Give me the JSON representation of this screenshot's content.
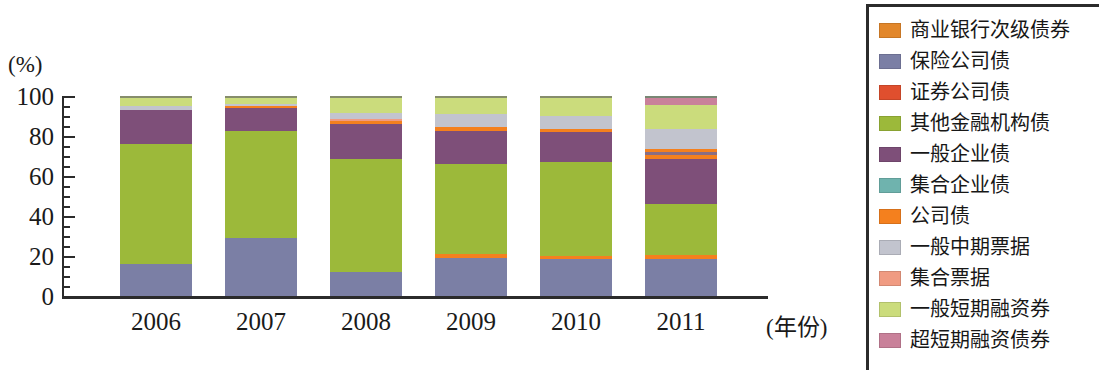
{
  "chart_data": {
    "type": "bar",
    "subtype": "stacked-100-percent",
    "title": "",
    "xlabel": "(年份)",
    "ylabel": "(%)",
    "ylim": [
      0,
      100
    ],
    "yticks": [
      0,
      20,
      40,
      60,
      80,
      100
    ],
    "ytick_labels": [
      "0",
      "20",
      "40",
      "60",
      "80",
      "100"
    ],
    "grid": false,
    "legend_position": "right",
    "categories": [
      "2006",
      "2007",
      "2008",
      "2009",
      "2010",
      "2011"
    ],
    "series": [
      {
        "name": "商业银行次级债券",
        "color": "#E2872B",
        "values": [
          0,
          0,
          0,
          0,
          0,
          0
        ]
      },
      {
        "name": "保险公司债",
        "color": "#7B7FA5",
        "values": [
          16.0,
          29.0,
          12.0,
          19.0,
          18.5,
          19.0
        ]
      },
      {
        "name": "证券公司债",
        "color": "#E04F2E",
        "values": [
          0,
          0,
          0,
          0,
          0,
          0
        ]
      },
      {
        "name": "其他金融机构债",
        "color": "#9CB93A",
        "values": [
          60.0,
          53.5,
          56.5,
          45.0,
          47.0,
          26.0
        ]
      },
      {
        "name": "一般企业债",
        "color": "#7E4F79",
        "values": [
          17.0,
          11.5,
          17.5,
          16.5,
          15.0,
          23.0
        ]
      },
      {
        "name": "集合企业债",
        "color": "#6FB3AE",
        "values": [
          0,
          0,
          0,
          0,
          0,
          0.8
        ]
      },
      {
        "name": "公司债",
        "color": "#F4801E",
        "values": [
          0,
          0.8,
          1.5,
          4.0,
          3.0,
          5.0
        ]
      },
      {
        "name": "一般中期票据",
        "color": "#C2C4CE",
        "values": [
          2.0,
          1.0,
          3.0,
          6.5,
          6.5,
          10.0
        ]
      },
      {
        "name": "集合票据",
        "color": "#F09B82",
        "values": [
          0,
          0,
          1.0,
          0,
          0,
          0
        ]
      },
      {
        "name": "一般短期融资券",
        "color": "#CBDC7C",
        "values": [
          5.0,
          4.2,
          8.5,
          9.0,
          10.0,
          12.5
        ]
      },
      {
        "name": "超短期融资债券",
        "color": "#C9819A",
        "values": [
          0,
          0,
          0,
          0,
          0,
          3.7
        ]
      }
    ],
    "stack_order_by_category": {
      "2006": [
        {
          "name": "保险公司债",
          "color": "#7B7FA5",
          "value": 16.0
        },
        {
          "name": "其他金融机构债",
          "color": "#9CB93A",
          "value": 60.0
        },
        {
          "name": "一般企业债",
          "color": "#7E4F79",
          "value": 17.0
        },
        {
          "name": "一般中期票据",
          "color": "#C2C4CE",
          "value": 2.0
        },
        {
          "name": "一般短期融资券",
          "color": "#CBDC7C",
          "value": 5.0
        }
      ],
      "2007": [
        {
          "name": "保险公司债",
          "color": "#7B7FA5",
          "value": 29.0
        },
        {
          "name": "其他金融机构债",
          "color": "#9CB93A",
          "value": 53.5
        },
        {
          "name": "一般企业债",
          "color": "#7E4F79",
          "value": 11.5
        },
        {
          "name": "公司债",
          "color": "#F4801E",
          "value": 0.8
        },
        {
          "name": "一般中期票据",
          "color": "#C2C4CE",
          "value": 1.0
        },
        {
          "name": "一般短期融资券",
          "color": "#CBDC7C",
          "value": 4.2
        }
      ],
      "2008": [
        {
          "name": "保险公司债",
          "color": "#7B7FA5",
          "value": 12.0
        },
        {
          "name": "其他金融机构债",
          "color": "#9CB93A",
          "value": 56.5
        },
        {
          "name": "一般企业债",
          "color": "#7E4F79",
          "value": 17.5
        },
        {
          "name": "公司债",
          "color": "#F4801E",
          "value": 1.5
        },
        {
          "name": "集合票据",
          "color": "#F09B82",
          "value": 1.0
        },
        {
          "name": "一般中期票据",
          "color": "#C2C4CE",
          "value": 3.0
        },
        {
          "name": "一般短期融资券",
          "color": "#CBDC7C",
          "value": 8.5
        }
      ],
      "2009": [
        {
          "name": "保险公司债",
          "color": "#7B7FA5",
          "value": 19.0
        },
        {
          "name": "公司债",
          "color": "#F4801E",
          "value": 2.0
        },
        {
          "name": "其他金融机构债",
          "color": "#9CB93A",
          "value": 45.0
        },
        {
          "name": "一般企业债",
          "color": "#7E4F79",
          "value": 16.5
        },
        {
          "name": "公司债",
          "color": "#F4801E",
          "value": 2.0
        },
        {
          "name": "一般中期票据",
          "color": "#C2C4CE",
          "value": 6.5
        },
        {
          "name": "一般短期融资券",
          "color": "#CBDC7C",
          "value": 9.0
        }
      ],
      "2010": [
        {
          "name": "保险公司债",
          "color": "#7B7FA5",
          "value": 18.5
        },
        {
          "name": "公司债",
          "color": "#F4801E",
          "value": 1.5
        },
        {
          "name": "其他金融机构债",
          "color": "#9CB93A",
          "value": 47.0
        },
        {
          "name": "一般企业债",
          "color": "#7E4F79",
          "value": 15.0
        },
        {
          "name": "公司债",
          "color": "#F4801E",
          "value": 1.5
        },
        {
          "name": "一般中期票据",
          "color": "#C2C4CE",
          "value": 6.5
        },
        {
          "name": "一般短期融资券",
          "color": "#CBDC7C",
          "value": 10.0
        }
      ],
      "2011": [
        {
          "name": "保险公司债",
          "color": "#7B7FA5",
          "value": 19.0
        },
        {
          "name": "公司债",
          "color": "#F4801E",
          "value": 2.0
        },
        {
          "name": "其他金融机构债",
          "color": "#9CB93A",
          "value": 26.0
        },
        {
          "name": "一般企业债",
          "color": "#7E4F79",
          "value": 23.0
        },
        {
          "name": "公司债",
          "color": "#F4801E",
          "value": 2.5
        },
        {
          "name": "一般企业债",
          "color": "#8A6E84",
          "value": 1.5
        },
        {
          "name": "公司债",
          "color": "#F4801E",
          "value": 1.5
        },
        {
          "name": "一般中期票据",
          "color": "#C2C4CE",
          "value": 10.0
        },
        {
          "name": "一般短期融资券",
          "color": "#CBDC7C",
          "value": 12.5
        },
        {
          "name": "超短期融资债券",
          "color": "#C9819A",
          "value": 3.7
        },
        {
          "name": "集合企业债",
          "color": "#6FB3AE",
          "value": 0.8
        }
      ]
    }
  },
  "axes": {
    "y_unit": "(%)",
    "x_unit": "(年份)",
    "y_tick_labels": [
      "100",
      "80",
      "60",
      "40",
      "20",
      "0"
    ],
    "x_tick_labels": [
      "2006",
      "2007",
      "2008",
      "2009",
      "2010",
      "2011"
    ]
  },
  "legend": {
    "items": [
      {
        "label": "商业银行次级债券",
        "color": "#E2872B"
      },
      {
        "label": "保险公司债",
        "color": "#7B7FA5"
      },
      {
        "label": "证券公司债",
        "color": "#E04F2E"
      },
      {
        "label": "其他金融机构债",
        "color": "#9CB93A"
      },
      {
        "label": "一般企业债",
        "color": "#7E4F79"
      },
      {
        "label": "集合企业债",
        "color": "#6FB3AE"
      },
      {
        "label": "公司债",
        "color": "#F4801E"
      },
      {
        "label": "一般中期票据",
        "color": "#C2C4CE"
      },
      {
        "label": "集合票据",
        "color": "#F09B82"
      },
      {
        "label": "一般短期融资券",
        "color": "#CBDC7C"
      },
      {
        "label": "超短期融资债券",
        "color": "#C9819A"
      }
    ]
  }
}
